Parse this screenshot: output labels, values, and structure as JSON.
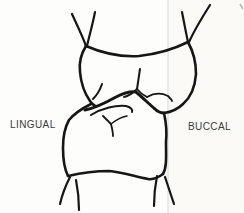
{
  "figure": {
    "type": "dental-occlusion-line-drawing",
    "labels": {
      "left": "LINGUAL",
      "right": "BUCCAL"
    },
    "colors": {
      "line": "#161616",
      "label_text": "#3a3a3a",
      "background": "#fdfdfc",
      "scan_band_fill": "#faf8f3",
      "scan_band_edge": "#eceae4",
      "corner_mark": "#b9b6b0"
    },
    "paths": [
      {
        "name": "upper-root-left-outer",
        "d": "M 72,14 C 76,23 82,35 86,46",
        "w": 2.2
      },
      {
        "name": "upper-root-left-inner",
        "d": "M 95,12 C 93,23 89,37 87,46",
        "w": 2.2
      },
      {
        "name": "upper-cervical-top-edge",
        "d": "M 86,46 C 102,53 122,57 139,56 C 158,54 176,48 188,42",
        "w": 2.6
      },
      {
        "name": "upper-root-right-inner",
        "d": "M 182,12 C 184,22 186,33 188,42",
        "w": 2.2
      },
      {
        "name": "upper-root-right-outer",
        "d": "M 210,5 C 203,16 194,31 189,42",
        "w": 2.2
      },
      {
        "name": "upper-buccal-side",
        "d": "M 188,42 C 193,51 196,63 196,74 C 195,88 190,98 183,104 C 178,109 171,112 164,113",
        "w": 2.6
      },
      {
        "name": "upper-lingual-side",
        "d": "M 86,46 C 81,54 79,64 80,72 C 81,83 85,94 90,101 C 92,104 94,105 95,106",
        "w": 2.6
      },
      {
        "name": "upper-lingual-cusp-line",
        "d": "M 102,84 C 100,90 97,95 93,99",
        "w": 2.0
      },
      {
        "name": "upper-central-groove",
        "d": "M 140,69 C 139,76 138,82 137,89",
        "w": 2.0
      },
      {
        "name": "upper-groove-left-flick",
        "d": "M 137,89 C 133,93 129,96 124,97",
        "w": 1.8
      },
      {
        "name": "upper-groove-right-flick",
        "d": "M 137,89 C 140,93 143,95 147,97",
        "w": 1.8
      },
      {
        "name": "upper-distal-ridge-arc",
        "d": "M 147,97 C 154,93 162,93 168,96 C 170,98 172,100 172,101",
        "w": 1.8
      },
      {
        "name": "occlusal-contact-line",
        "d": "M 85,110 C 96,108 107,102 116,97 C 124,93 131,91 136,92 C 142,97 149,104 155,109 C 158,112 161,113 164,113",
        "w": 3.0
      },
      {
        "name": "lower-lingual-side",
        "d": "M 91,104 C 83,108 74,114 69,120 C 65,127 63,137 63,148 C 63,158 64,168 68,176",
        "w": 2.6
      },
      {
        "name": "lower-cervical-bottom",
        "d": "M 68,176 C 81,173 96,171 109,171 C 122,172 136,177 148,179 C 154,180 159,177 163,174",
        "w": 2.6
      },
      {
        "name": "lower-buccal-side",
        "d": "M 164,113 C 166,122 167,132 166,142 C 166,156 167,167 163,174",
        "w": 2.6
      },
      {
        "name": "lower-root-left-outer",
        "d": "M 70,177 C 66,185 62,195 60,204",
        "w": 2.2
      },
      {
        "name": "lower-root-left-inner",
        "d": "M 76,180 C 78,190 79,200 79,210",
        "w": 2.2
      },
      {
        "name": "lower-root-right-inner",
        "d": "M 157,176 C 155,186 154,196 154,206",
        "w": 2.2
      },
      {
        "name": "lower-root-right-outer",
        "d": "M 165,177 C 168,186 171,195 174,204",
        "w": 2.2
      },
      {
        "name": "lower-marginal-ridge-arc",
        "d": "M 91,115 C 102,108 116,105 126,106 C 130,107 133,109 132,112",
        "w": 2.0
      },
      {
        "name": "lower-ridge-left-arm",
        "d": "M 103,116 C 106,119 109,122 111,124",
        "w": 1.8
      },
      {
        "name": "lower-ridge-right-arm",
        "d": "M 111,124 C 116,120 121,117 127,116",
        "w": 1.6
      },
      {
        "name": "lower-ridge-stem",
        "d": "M 111,124 C 112,128 113,132 113,136",
        "w": 1.8
      }
    ],
    "scan_band": {
      "x": 168,
      "width": 76,
      "edge_x": 168
    },
    "corner_mark_d": "M 240,4 L 243,9"
  }
}
